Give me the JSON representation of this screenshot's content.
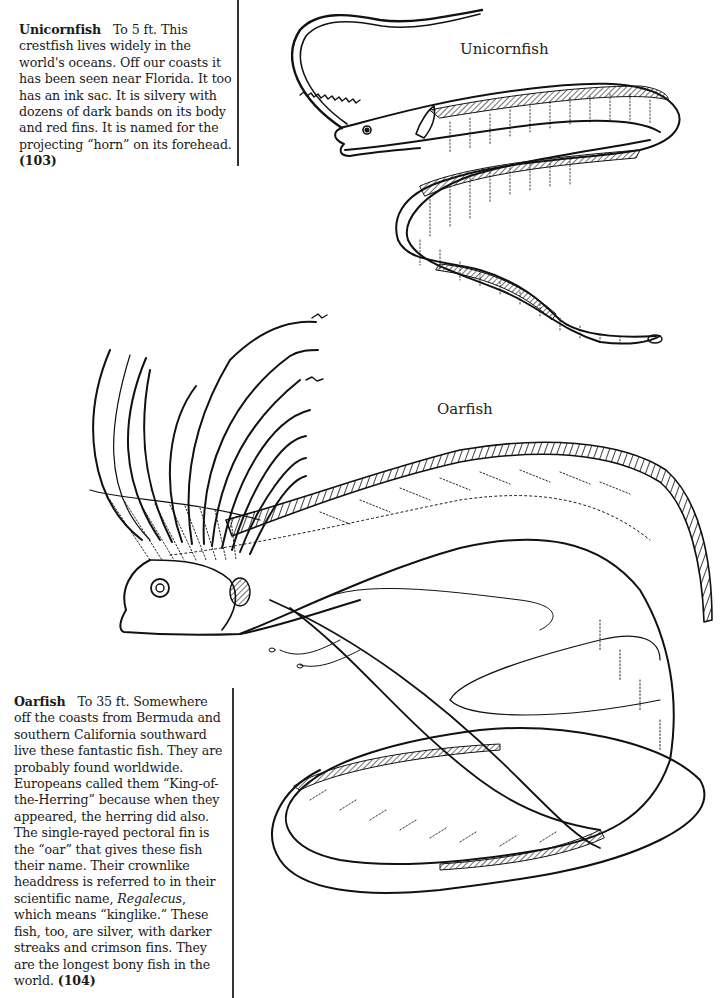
{
  "page": {
    "type": "coloring-book page",
    "entries": [
      {
        "id": "unicornfish",
        "name": "Unicornfish",
        "size": "To 5 ft.",
        "text": "This crestfish lives widely in the world's oceans. Off our coasts it has been seen near Florida. It too has an ink sac. It is silvery with dozens of dark bands on its body and red fins. It is named for the projecting “horn” on its forehead.",
        "plate_number": "(103)",
        "illustration_label": "Unicornfish"
      },
      {
        "id": "oarfish",
        "name": "Oarfish",
        "size": "To 35 ft.",
        "text_part1": "Somewhere off the coasts from Bermuda and southern California southward live these fantastic fish. They are probably found worldwide. Europeans called them “King-of-the-Herring” because when they appeared, the herring did also. The single-rayed pectoral fin is the “oar” that gives these fish their name. Their crownlike headdress is referred to in their scientific name,",
        "scientific_name": "Regalecus",
        "text_part2": ", which means “kinglike.” These fish, too, are silver, with darker streaks and crimson fins. They are the longest bony fish in the world.",
        "plate_number": "(104)",
        "illustration_label": "Oarfish"
      }
    ]
  }
}
